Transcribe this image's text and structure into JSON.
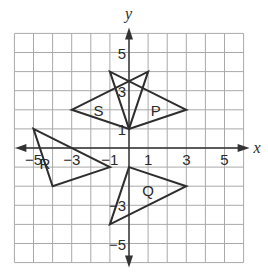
{
  "diagram": {
    "type": "coordinate-plane",
    "x_axis_label": "x",
    "y_axis_label": "y",
    "range": {
      "xmin": -6,
      "xmax": 6,
      "ymin": -6,
      "ymax": 6
    },
    "x_ticks": [
      {
        "value": -5,
        "label": "−5"
      },
      {
        "value": -3,
        "label": "−3"
      },
      {
        "value": -1,
        "label": "−1"
      },
      {
        "value": 1,
        "label": "1"
      },
      {
        "value": 3,
        "label": "3"
      },
      {
        "value": 5,
        "label": "5"
      }
    ],
    "y_ticks": [
      {
        "value": 5,
        "label": "5"
      },
      {
        "value": 3,
        "label": "3"
      },
      {
        "value": 1,
        "label": "1"
      },
      {
        "value": -3,
        "label": "−3"
      },
      {
        "value": -5,
        "label": "−5"
      }
    ],
    "shapes": [
      {
        "name": "S",
        "label": "S",
        "vertices": [
          [
            -3,
            2
          ],
          [
            1,
            4
          ],
          [
            0,
            1
          ]
        ],
        "label_at": [
          -1.6,
          2
        ]
      },
      {
        "name": "P",
        "label": "P",
        "vertices": [
          [
            3,
            2
          ],
          [
            -1,
            4
          ],
          [
            0,
            1
          ]
        ],
        "label_at": [
          1.4,
          2
        ]
      },
      {
        "name": "R",
        "label": "R",
        "vertices": [
          [
            -5,
            1
          ],
          [
            -1,
            -1
          ],
          [
            -4,
            -2
          ]
        ],
        "label_at": [
          -4.4,
          -0.8
        ]
      },
      {
        "name": "Q",
        "label": "Q",
        "vertices": [
          [
            0,
            -1
          ],
          [
            3,
            -2
          ],
          [
            -1,
            -4
          ]
        ],
        "label_at": [
          1,
          -2.2
        ]
      }
    ]
  }
}
